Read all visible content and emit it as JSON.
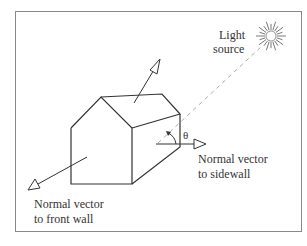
{
  "figure": {
    "type": "diagram",
    "labels": {
      "light_source": [
        "Light",
        "source"
      ],
      "sidewall_normal": [
        "Normal vector",
        "to sidewall"
      ],
      "front_wall_normal": [
        "Normal vector",
        "to front wall"
      ],
      "angle": "θ"
    },
    "colors": {
      "line": "#333333",
      "dashed": "#aaaaaa",
      "frame": "#888888",
      "background": "#ffffff"
    }
  }
}
